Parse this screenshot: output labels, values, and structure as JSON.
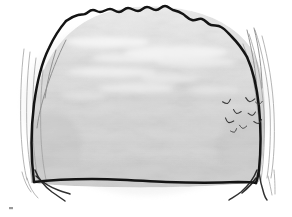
{
  "artwork": {
    "title": "Rock Outcrop Sketch",
    "medium": "ink line drawing with gray wash",
    "caption": "Hand-drawn sketch of a large rounded boulder or rock mass with a flock of small birds at the right",
    "background_color": "#ffffff",
    "canvas": {
      "width": 292,
      "height": 217
    }
  },
  "palette": {
    "paper": "#ffffff",
    "ink": "#1a1a1a",
    "wash_light": "#e9e9e9",
    "wash_mid": "#d9d9d9",
    "wash_dark": "#cccccc",
    "wash_highlight": "#f4f4f4",
    "faint_line": "#9a9a9a",
    "bird_ink": "#3a3a3a"
  },
  "elements": {
    "boulder": {
      "label": "Rounded rock mass",
      "outline_color": "#1a1a1a",
      "fill_color": "#d9d9d9"
    },
    "top_ridge": {
      "label": "Jagged upper contour of the rock"
    },
    "left_edge": {
      "label": "Left contour line of the rock"
    },
    "right_edge": {
      "label": "Right contour line of the rock"
    },
    "base_line": {
      "label": "Lower base line of the rock"
    },
    "left_fissures": {
      "label": "Faint parallel crack lines at the left flank",
      "count": 4
    },
    "right_fissures": {
      "label": "Faint parallel crack lines at the right flank",
      "count": 4
    },
    "bottom_left_branch": {
      "label": "Branching crack at the lower-left corner"
    },
    "bottom_right_branch": {
      "label": "Branching crack at the lower-right corner"
    },
    "wash_texture": {
      "label": "Mottled gray wash shading across the rock face"
    },
    "highlight_streaks": {
      "label": "Pale highlight streaks across the upper rock face",
      "count": 7
    },
    "bird_flock": {
      "label": "Flock of small flying birds",
      "count": 9,
      "birds": [
        {
          "name": "bird-1",
          "x": 227,
          "y": 102,
          "size": 4.2,
          "rotation": -18
        },
        {
          "name": "bird-2",
          "x": 250,
          "y": 100,
          "size": 4.6,
          "rotation": 8
        },
        {
          "name": "bird-3",
          "x": 259,
          "y": 103,
          "size": 3.4,
          "rotation": -6
        },
        {
          "name": "bird-4",
          "x": 237,
          "y": 112,
          "size": 4.0,
          "rotation": 14
        },
        {
          "name": "bird-5",
          "x": 252,
          "y": 114,
          "size": 3.8,
          "rotation": -10
        },
        {
          "name": "bird-6",
          "x": 229,
          "y": 121,
          "size": 4.4,
          "rotation": 20
        },
        {
          "name": "bird-7",
          "x": 258,
          "y": 122,
          "size": 4.0,
          "rotation": -14
        },
        {
          "name": "bird-8",
          "x": 243,
          "y": 127,
          "size": 3.6,
          "rotation": 6
        },
        {
          "name": "bird-9",
          "x": 234,
          "y": 131,
          "size": 3.2,
          "rotation": -22
        }
      ]
    },
    "corner_mark": {
      "label": "Small ink speck near the bottom-left corner"
    }
  }
}
